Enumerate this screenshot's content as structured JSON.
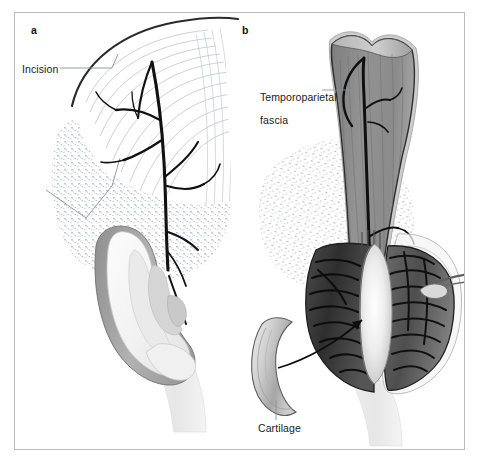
{
  "figure": {
    "panels": [
      {
        "id": "a",
        "label": "a",
        "caption_labels": [
          {
            "name": "incision",
            "text": "Incision"
          }
        ]
      },
      {
        "id": "b",
        "label": "b",
        "caption_labels": [
          {
            "name": "temporoparietal-fascia",
            "text": "Temporoparietal\nfascia"
          },
          {
            "name": "cartilage",
            "text": "Cartilage"
          }
        ]
      }
    ],
    "labels": {
      "panel_a": "a",
      "panel_b": "b",
      "incision": "Incision",
      "temporoparietal_fascia_line1": "Temporoparietal",
      "temporoparietal_fascia_line2": "fascia",
      "cartilage": "Cartilage"
    },
    "colors": {
      "frame_border": "#b9bcbe",
      "background": "#ffffff",
      "ink": "#1a1a1a",
      "leader_line": "#6e7376",
      "fascia_gray": "#8a8a8a",
      "fascia_gray_dark": "#6f6f6f",
      "fascia_edge": "#3a3a3a",
      "helix_gray": "#a8a8a8",
      "skin_light": "#f2f2f2",
      "skin_shadow": "#dcdcdc",
      "stipple_gray": "#9aa0a4",
      "pocket_dark": "#3a3a3a",
      "pocket_darker": "#2a2a2a",
      "cartilage_light": "#e8e8e8",
      "cartilage_mid": "#c2c2c2",
      "vessel_black": "#111111"
    },
    "graphic_elements": {
      "panel_a": [
        "incision-arc",
        "temporal-hairline-hatching",
        "superficial-temporal-artery-branches",
        "stippled-shaved-scalp",
        "auricle-ear",
        "helix-rim",
        "antihelix",
        "concha",
        "tragus",
        "lobule",
        "neck-skin"
      ],
      "panel_b": [
        "temporoparietal-fascia-flap",
        "fascia-vessel-branches",
        "stippled-shaved-scalp",
        "elevated-auricle-flap",
        "open-pocket-dark",
        "cartilage-graft-inset",
        "cartilage-graft-crescent",
        "transfer-arrow",
        "retractor-instrument",
        "neck-skin"
      ]
    }
  }
}
